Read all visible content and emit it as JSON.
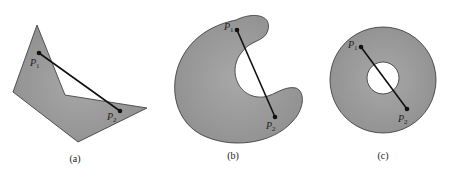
{
  "colors": {
    "fill": "#9a9a9a",
    "stroke": "#333333",
    "line": "#111111",
    "background": "#ffffff"
  },
  "panels": [
    {
      "caption": "(a)",
      "shape": "non-convex polygon",
      "points": [
        {
          "label": "P",
          "sub": "1"
        },
        {
          "label": "P",
          "sub": "2"
        }
      ]
    },
    {
      "caption": "(b)",
      "shape": "crescent (non-convex)",
      "points": [
        {
          "label": "P",
          "sub": "1"
        },
        {
          "label": "P",
          "sub": "2"
        }
      ]
    },
    {
      "caption": "(c)",
      "shape": "annulus (ring with hole)",
      "points": [
        {
          "label": "P",
          "sub": "1"
        },
        {
          "label": "P",
          "sub": "2"
        }
      ]
    }
  ]
}
